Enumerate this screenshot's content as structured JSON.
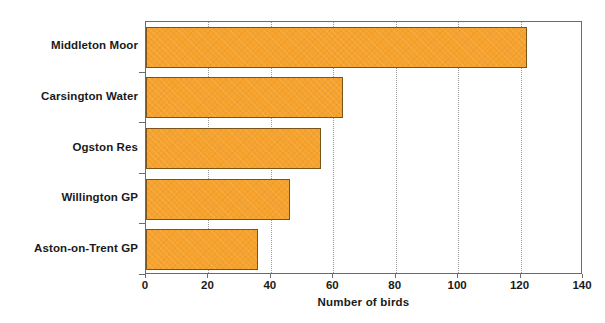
{
  "chart_data": {
    "type": "bar",
    "orientation": "horizontal",
    "title": "",
    "xlabel": "Number of birds",
    "ylabel": "",
    "categories": [
      "Middleton Moor",
      "Carsington Water",
      "Ogston Res",
      "Willington GP",
      "Aston-on-Trent GP"
    ],
    "values": [
      122,
      63,
      56,
      46,
      36
    ],
    "xlim": [
      0,
      140
    ],
    "xticks": [
      0,
      20,
      40,
      60,
      80,
      100,
      120,
      140
    ],
    "xtick_labels": [
      "0",
      "20",
      "40",
      "60",
      "80",
      "100",
      "120",
      "140"
    ],
    "grid": "vertical-dotted",
    "legend": "none",
    "bar_color": "#f5a22e",
    "bar_edge_color": "#7a5418",
    "axis_color": "#6b6b6b",
    "gridline_color": "#9a9a9a",
    "background": "#ffffff"
  }
}
